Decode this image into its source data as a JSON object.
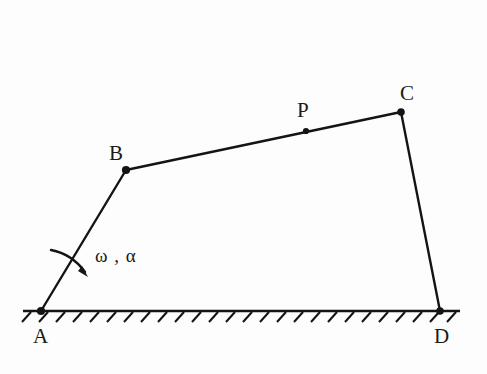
{
  "figure": {
    "type": "mechanism-linkage-diagram",
    "background_color": "#fdfdfd",
    "stroke_color": "#141414",
    "canvas": {
      "width": 487,
      "height": 374
    },
    "ground": {
      "label": "ground-hatching",
      "line": {
        "x1": 23,
        "y1": 311,
        "x2": 460,
        "y2": 311
      },
      "hatch_count": 26,
      "hatch_spacing": 17,
      "hatch_dx": -9,
      "hatch_dy": 10
    },
    "joints": [
      {
        "id": "A",
        "label": "A",
        "x": 41,
        "y": 311,
        "label_x": 33,
        "label_y": 327,
        "kind": "fixed-pivot"
      },
      {
        "id": "B",
        "label": "B",
        "x": 126,
        "y": 170,
        "label_x": 109,
        "label_y": 144,
        "kind": "pin-joint"
      },
      {
        "id": "P",
        "label": "P",
        "x": 306,
        "y": 131,
        "label_x": 297,
        "label_y": 101,
        "kind": "point-of-interest"
      },
      {
        "id": "C",
        "label": "C",
        "x": 401,
        "y": 112,
        "label_x": 400,
        "label_y": 84,
        "kind": "pin-joint"
      },
      {
        "id": "D",
        "label": "D",
        "x": 440,
        "y": 311,
        "label_x": 434,
        "label_y": 327,
        "kind": "fixed-pivot"
      }
    ],
    "links": [
      {
        "id": "AB",
        "from": "A",
        "to": "B",
        "x1": 41,
        "y1": 311,
        "x2": 126,
        "y2": 170
      },
      {
        "id": "BC",
        "from": "B",
        "to": "C",
        "x1": 126,
        "y1": 170,
        "x2": 401,
        "y2": 112
      },
      {
        "id": "CD",
        "from": "C",
        "to": "D",
        "x1": 401,
        "y1": 112,
        "x2": 440,
        "y2": 311
      }
    ],
    "annotation": {
      "id": "omega-alpha",
      "text": "ω , α",
      "symbols": [
        "ω",
        "α"
      ],
      "meaning": "angular-velocity-and-angular-acceleration-of-link-AB",
      "label_x": 95,
      "label_y": 246,
      "arrow": {
        "path": "M 52 251 Q 72 255 86 275",
        "tail_x": 52,
        "tail_y": 251,
        "head_x": 86,
        "head_y": 275,
        "direction": "clockwise"
      }
    },
    "ghost_text": ""
  }
}
